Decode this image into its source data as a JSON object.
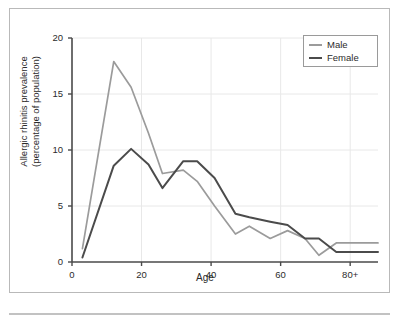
{
  "figure": {
    "frame_border_color": "#b9b9b9",
    "background": "#ffffff",
    "bottom_rule_color": "#c2c2c2"
  },
  "axes": {
    "x_label": "Age",
    "y_label_line1": "Allergic rhinitis prevalence",
    "y_label_line2": "(percentage of population)",
    "x_ticks": [
      "0",
      "20",
      "40",
      "60",
      "80+"
    ],
    "y_ticks": [
      "0",
      "5",
      "10",
      "15",
      "20"
    ],
    "axis_color": "#4a4a4a",
    "grid_color": "#e8e8e8"
  },
  "legend": {
    "position": "top-right",
    "entries": [
      {
        "label": "Male",
        "color": "#9b9b9b"
      },
      {
        "label": "Female",
        "color": "#4b4b4b"
      }
    ]
  },
  "chart_data": {
    "type": "line",
    "title": "",
    "xlabel": "Age",
    "ylabel": "Allergic rhinitis prevalence (percentage of population)",
    "xlim": [
      0,
      88
    ],
    "ylim": [
      0,
      20
    ],
    "x_ticks": [
      0,
      20,
      40,
      60,
      80
    ],
    "x_tick_labels": [
      "0",
      "20",
      "40",
      "60",
      "80+"
    ],
    "y_ticks": [
      0,
      5,
      10,
      15,
      20
    ],
    "grid": true,
    "legend_position": "top-right",
    "series": [
      {
        "name": "Male",
        "color": "#9b9b9b",
        "x": [
          3,
          12,
          17,
          22,
          26,
          32,
          36,
          41,
          47,
          51,
          57,
          62,
          67,
          71,
          76,
          80,
          88
        ],
        "values": [
          1.2,
          17.9,
          15.6,
          11.5,
          7.9,
          8.2,
          7.2,
          5.0,
          2.5,
          3.2,
          2.1,
          2.8,
          2.1,
          0.6,
          1.7,
          1.7,
          1.7
        ]
      },
      {
        "name": "Female",
        "color": "#4b4b4b",
        "x": [
          3,
          12,
          17,
          22,
          26,
          32,
          36,
          41,
          47,
          51,
          57,
          62,
          67,
          71,
          76,
          80,
          88
        ],
        "values": [
          0.4,
          8.6,
          10.1,
          8.7,
          6.6,
          9.0,
          9.0,
          7.5,
          4.3,
          4.0,
          3.6,
          3.3,
          2.1,
          2.1,
          0.9,
          0.9,
          0.9
        ]
      }
    ]
  }
}
